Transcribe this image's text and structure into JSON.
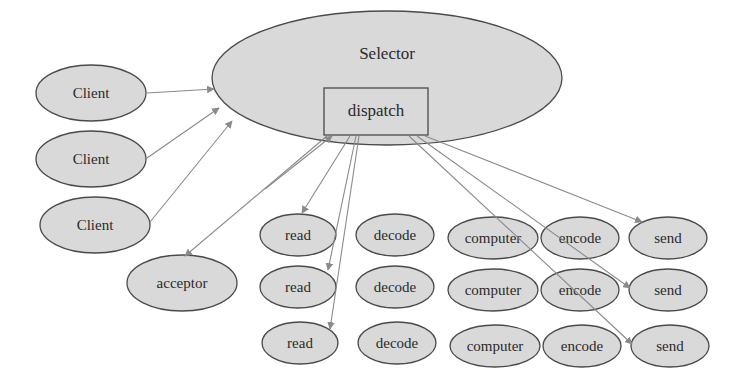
{
  "colors": {
    "node_fill": "#d9d9d9",
    "node_stroke": "#4a4a4a",
    "edge": "#8a8a8a",
    "text": "#2a2a2a",
    "background": "#ffffff"
  },
  "selector": {
    "label": "Selector",
    "shape": "ellipse",
    "cx": 387,
    "cy": 78,
    "rx": 175,
    "ry": 67,
    "dispatch": {
      "label": "dispatch",
      "shape": "rect",
      "x": 324,
      "y": 88,
      "w": 104,
      "h": 47
    }
  },
  "clients": [
    {
      "label": "Client",
      "cx": 91,
      "cy": 93,
      "rx": 55,
      "ry": 28
    },
    {
      "label": "Client",
      "cx": 91,
      "cy": 159,
      "rx": 55,
      "ry": 28
    },
    {
      "label": "Client",
      "cx": 95,
      "cy": 225,
      "rx": 55,
      "ry": 28
    }
  ],
  "acceptor": {
    "label": "acceptor",
    "cx": 182,
    "cy": 283,
    "rx": 55,
    "ry": 28
  },
  "pipeline_rows": [
    [
      {
        "label": "read",
        "cx": 298,
        "cy": 235,
        "rx": 38,
        "ry": 21
      },
      {
        "label": "decode",
        "cx": 395,
        "cy": 235,
        "rx": 39,
        "ry": 21
      },
      {
        "label": "computer",
        "cx": 493,
        "cy": 238,
        "rx": 45,
        "ry": 21
      },
      {
        "label": "encode",
        "cx": 580,
        "cy": 238,
        "rx": 39,
        "ry": 21
      },
      {
        "label": "send",
        "cx": 668,
        "cy": 238,
        "rx": 39,
        "ry": 21
      }
    ],
    [
      {
        "label": "read",
        "cx": 298,
        "cy": 287,
        "rx": 38,
        "ry": 21
      },
      {
        "label": "decode",
        "cx": 395,
        "cy": 287,
        "rx": 39,
        "ry": 21
      },
      {
        "label": "computer",
        "cx": 493,
        "cy": 290,
        "rx": 45,
        "ry": 21
      },
      {
        "label": "encode",
        "cx": 580,
        "cy": 290,
        "rx": 39,
        "ry": 21
      },
      {
        "label": "send",
        "cx": 668,
        "cy": 290,
        "rx": 39,
        "ry": 21
      }
    ],
    [
      {
        "label": "read",
        "cx": 300,
        "cy": 343,
        "rx": 38,
        "ry": 21
      },
      {
        "label": "decode",
        "cx": 397,
        "cy": 343,
        "rx": 39,
        "ry": 21
      },
      {
        "label": "computer",
        "cx": 495,
        "cy": 346,
        "rx": 45,
        "ry": 21
      },
      {
        "label": "encode",
        "cx": 582,
        "cy": 346,
        "rx": 39,
        "ry": 21
      },
      {
        "label": "send",
        "cx": 670,
        "cy": 346,
        "rx": 39,
        "ry": 21
      }
    ]
  ],
  "edges": [
    {
      "from": "client-1",
      "to": "selector",
      "x1": 147,
      "y1": 93,
      "x2": 214,
      "y2": 89
    },
    {
      "from": "client-2",
      "to": "selector",
      "x1": 147,
      "y1": 158,
      "x2": 219,
      "y2": 108
    },
    {
      "from": "client-3",
      "to": "selector",
      "x1": 150,
      "y1": 222,
      "x2": 232,
      "y2": 121
    },
    {
      "from": "dispatch",
      "to": "acceptor",
      "x1": 327,
      "y1": 136,
      "x2": 185,
      "y2": 256
    },
    {
      "from": "acceptor",
      "to": "dispatch",
      "x1": 265,
      "y1": 189,
      "x2": 332,
      "y2": 136
    },
    {
      "from": "dispatch",
      "to": "read-1",
      "x1": 350,
      "y1": 136,
      "x2": 302,
      "y2": 213
    },
    {
      "from": "dispatch",
      "to": "read-2",
      "x1": 356,
      "y1": 136,
      "x2": 328,
      "y2": 270
    },
    {
      "from": "dispatch",
      "to": "read-3",
      "x1": 359,
      "y1": 136,
      "x2": 330,
      "y2": 329
    },
    {
      "from": "dispatch",
      "to": "send-1",
      "x1": 425,
      "y1": 136,
      "x2": 642,
      "y2": 222
    },
    {
      "from": "dispatch",
      "to": "send-2",
      "x1": 417,
      "y1": 136,
      "x2": 630,
      "y2": 288
    },
    {
      "from": "dispatch",
      "to": "send-3",
      "x1": 409,
      "y1": 136,
      "x2": 632,
      "y2": 344
    }
  ]
}
